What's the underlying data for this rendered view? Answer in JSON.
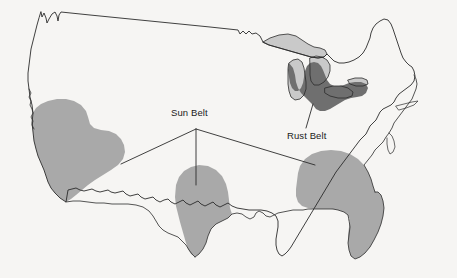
{
  "figure": {
    "name": "united-states-sun-belt-rust-belt-map",
    "type": "thematic-region-map",
    "width": 457,
    "height": 278,
    "background_color": "#f6f5f3",
    "outline_color": "#2b2b2b"
  },
  "labels": {
    "sun_belt": "Sun Belt",
    "rust_belt": "Rust Belt"
  },
  "regions": [
    {
      "id": "sun-belt-west",
      "label": "Sun Belt",
      "fill": "#a9a9a9",
      "description": "Southwest / California-Arizona-Nevada shaded area"
    },
    {
      "id": "sun-belt-texas",
      "label": "Sun Belt",
      "fill": "#a9a9a9",
      "description": "Texas shaded area"
    },
    {
      "id": "sun-belt-southeast",
      "label": "Sun Belt",
      "fill": "#a9a9a9",
      "description": "Southeast including Florida shaded area"
    },
    {
      "id": "rust-belt",
      "label": "Rust Belt",
      "fill": "#6f6f6f",
      "description": "Great Lakes industrial belt shaded area"
    },
    {
      "id": "great-lakes",
      "label": "Great Lakes",
      "fill": "#c9c9c9",
      "description": "Great Lakes water bodies"
    }
  ],
  "leader_lines": {
    "sun_belt_origin": {
      "x": 196,
      "y": 129
    },
    "sun_belt_targets": [
      {
        "x": 121,
        "y": 164
      },
      {
        "x": 196,
        "y": 185
      },
      {
        "x": 315,
        "y": 165
      }
    ],
    "rust_belt_origin": {
      "x": 306,
      "y": 128
    },
    "rust_belt_target": {
      "x": 313,
      "y": 108
    }
  },
  "colors": {
    "sun_belt_fill": "#a9a9a9",
    "rust_belt_fill": "#6f6f6f",
    "great_lakes_fill": "#c9c9c9",
    "outline": "#2b2b2b",
    "label_text": "#1b1b1b",
    "background": "#f6f5f3"
  }
}
